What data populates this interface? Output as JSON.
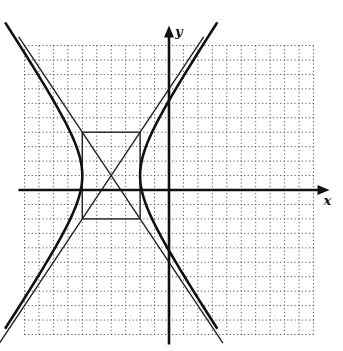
{
  "chart_data": {
    "type": "line",
    "title": "",
    "xlabel": "x",
    "ylabel": "y",
    "xlim": [
      -10,
      10
    ],
    "ylim": [
      -10,
      10
    ],
    "grid": true,
    "grid_style": "dotted",
    "legend": null,
    "series": [
      {
        "name": "hyperbola",
        "equation": "(x+4)^2/4 - (y-1)^2/9 = 1",
        "center": [
          -4,
          1
        ],
        "a": 2,
        "b": 3,
        "vertices": [
          [
            -6,
            1
          ],
          [
            -2,
            1
          ]
        ],
        "orientation": "horizontal"
      },
      {
        "name": "asymptote-1",
        "equation": "y - 1 = 1.5(x + 4)",
        "slope": 1.5
      },
      {
        "name": "asymptote-2",
        "equation": "y - 1 = -1.5(x + 4)",
        "slope": -1.5
      },
      {
        "name": "central-rectangle",
        "corners": [
          [
            -6,
            4
          ],
          [
            -2,
            4
          ],
          [
            -2,
            -2
          ],
          [
            -6,
            -2
          ]
        ]
      }
    ]
  },
  "axes": {
    "x_label": "x",
    "y_label": "y"
  },
  "colors": {
    "ink": "#111111",
    "grid": "#555555",
    "background": "#ffffff"
  }
}
